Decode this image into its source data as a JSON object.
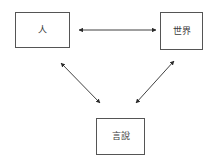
{
  "diagram": {
    "title": "",
    "background_color": "#ffffff",
    "line_color": "#2b2b2b",
    "box_border_color": "#555555",
    "nodes": [
      {
        "id": "person",
        "label": "人",
        "position": "top-left"
      },
      {
        "id": "world",
        "label": "世界",
        "position": "top-right"
      },
      {
        "id": "speech",
        "label": "言說",
        "position": "bottom-center"
      }
    ],
    "edges": [
      {
        "id": "person-world",
        "from": "person",
        "to": "world",
        "style": "double-headed-arrow",
        "label": ""
      },
      {
        "id": "person-speech",
        "from": "person",
        "to": "speech",
        "style": "double-headed-arrow",
        "label": ""
      },
      {
        "id": "speech-world",
        "from": "speech",
        "to": "world",
        "style": "double-headed-arrow",
        "label": ""
      }
    ]
  }
}
